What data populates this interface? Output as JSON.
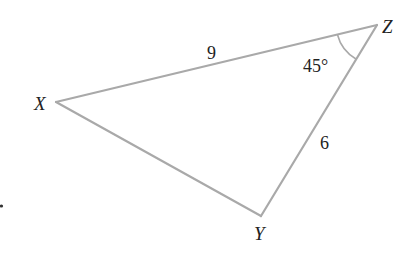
{
  "diagram": {
    "type": "triangle",
    "colors": {
      "line": "#a9a9a9",
      "text": "#222222",
      "background": "#ffffff"
    },
    "vertices": {
      "X": {
        "label": "X",
        "x": 56,
        "y": 102
      },
      "Y": {
        "label": "Y",
        "x": 261,
        "y": 216
      },
      "Z": {
        "label": "Z",
        "x": 377,
        "y": 25
      }
    },
    "sides": {
      "XZ": {
        "label": "9"
      },
      "ZY": {
        "label": "6"
      }
    },
    "angles": {
      "Z": {
        "label": "45°"
      }
    },
    "stray_mark": "."
  }
}
